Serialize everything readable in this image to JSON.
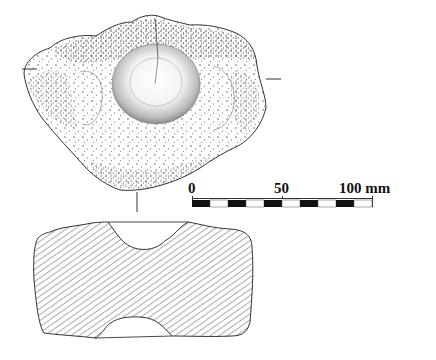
{
  "figure": {
    "type": "archaeological-artifact-drawing",
    "views": [
      {
        "name": "plan-view",
        "description": "Stippled drawing of stone with central circular pit"
      },
      {
        "name": "cross-section",
        "description": "Hatched section showing upper and lower depressions"
      }
    ]
  },
  "scale_bar": {
    "labels": [
      "0",
      "50",
      "100 mm"
    ],
    "label_0": "0",
    "label_50": "50",
    "label_100": "100 mm",
    "unit": "mm",
    "max": 100,
    "segments": 10,
    "segment_colors": [
      "#111111",
      "#ffffff"
    ]
  },
  "colors": {
    "ink": "#1a1a1a",
    "hatch": "#555555",
    "background": "#ffffff"
  }
}
